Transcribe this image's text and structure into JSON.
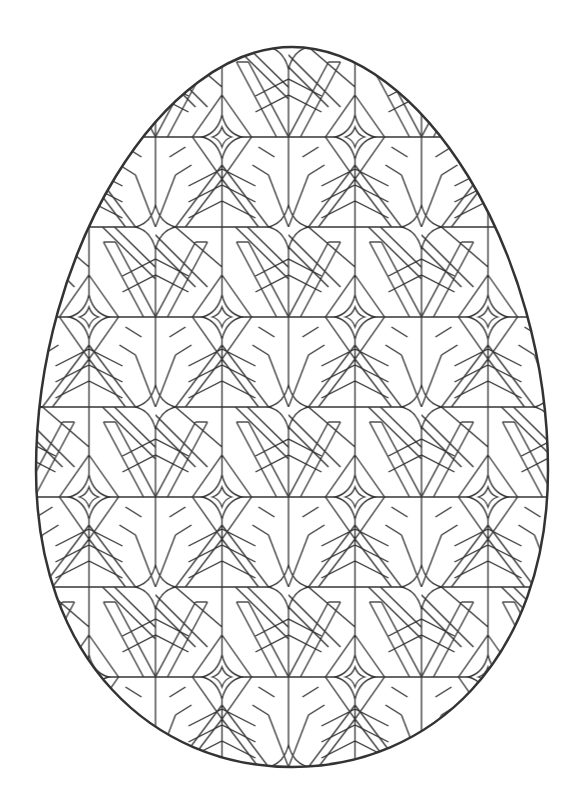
{
  "page": {
    "type": "coloring-page",
    "background_color": "#ffffff",
    "line_color": "#333333",
    "outline_color": "#333333"
  },
  "egg": {
    "center_x": 292,
    "top_y": 47,
    "bottom_y": 767,
    "left_x": 36,
    "right_x": 548,
    "outline_width": 2.5
  },
  "pattern": {
    "name": "geometric-star-lattice",
    "tile_width": 133,
    "tile_height": 180,
    "origin_x": 155.5,
    "origin_y": 47,
    "stroke_width": 1.3,
    "motifs": [
      "four-point-star",
      "chevron",
      "diagonal-band",
      "grid-line"
    ]
  }
}
